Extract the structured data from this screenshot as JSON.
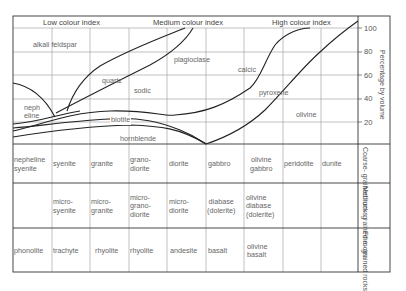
{
  "headers": {
    "low": "Low colour index",
    "medium": "Medium colour index",
    "high": "High colour index"
  },
  "y_axis": {
    "label": "Percentage by volume",
    "ticks": [
      "100",
      "80",
      "60",
      "40",
      "20"
    ]
  },
  "mineral_labels": {
    "alkali_feldspar": "alkali feldspar",
    "plagioclase": "plagioclase",
    "quartz": "quartz",
    "sodic": "sodic",
    "calcic": "calcic",
    "pyroxene": "pyroxene",
    "nepheline_1": "neph",
    "nepheline_2": "eline",
    "biotite": "biotite",
    "hornblende": "hornblende",
    "olivine": "olivine"
  },
  "rock_table": {
    "rows": [
      {
        "label_1": "Coarse-",
        "label_2": "grained",
        "label_3": "rocks",
        "cells": [
          [
            "nepheline",
            "syenite"
          ],
          [
            "syenite"
          ],
          [
            "granite"
          ],
          [
            "grano-",
            "diorite"
          ],
          [
            "diorite"
          ],
          [
            "gabbro"
          ],
          [
            "olivine",
            "gabbro"
          ],
          [
            "peridotite"
          ],
          [
            "dunite"
          ]
        ]
      },
      {
        "label_1": "Medium-",
        "label_2": "grained",
        "label_3": "rocks",
        "cells": [
          [],
          [
            "micro-",
            "syenite"
          ],
          [
            "micro-",
            "granite"
          ],
          [
            "micro-",
            "grano-",
            "diorite"
          ],
          [
            "micro-",
            "diorite"
          ],
          [
            "diabase",
            "(dolerite)"
          ],
          [
            "olivine",
            "diabase",
            "(dolerite)"
          ],
          [],
          []
        ]
      },
      {
        "label_1": "Fine-",
        "label_2": "grained",
        "label_3": "rocks",
        "cells": [
          [
            "phonolite"
          ],
          [
            "trachyte"
          ],
          [
            "rhyolite"
          ],
          [
            "rhyolite"
          ],
          [
            "andesite"
          ],
          [
            "basalt"
          ],
          [
            "olivine",
            "basalt"
          ],
          [],
          []
        ]
      }
    ]
  },
  "flat": {
    "r0c0a": "nepheline",
    "r0c0b": "syenite",
    "r0c1": "syenite",
    "r0c2": "granite",
    "r0c3a": "grano-",
    "r0c3b": "diorite",
    "r0c4": "diorite",
    "r0c5": "gabbro",
    "r0c6a": "olivine",
    "r0c6b": "gabbro",
    "r0c7": "peridotite",
    "r0c8": "dunite",
    "r1c1a": "micro-",
    "r1c1b": "syenite",
    "r1c2a": "micro-",
    "r1c2b": "granite",
    "r1c3a": "micro-",
    "r1c3b": "grano-",
    "r1c3c": "diorite",
    "r1c4a": "micro-",
    "r1c4b": "diorite",
    "r1c5a": "diabase",
    "r1c5b": "(dolerite)",
    "r1c6a": "olivine",
    "r1c6b": "diabase",
    "r1c6c": "(dolerite)",
    "r2c0": "phonolite",
    "r2c1": "trachyte",
    "r2c2": "rhyolite",
    "r2c3": "rhyolite",
    "r2c4": "andesite",
    "r2c5": "basalt",
    "r2c6a": "olivine",
    "r2c6b": "basalt",
    "row0": "Coarse- grained rocks",
    "row1": "Medium- grained rocks",
    "row2": "Fine- grained rocks"
  },
  "colors": {
    "line": "#222222",
    "grid": "#888888",
    "text": "#666666"
  }
}
